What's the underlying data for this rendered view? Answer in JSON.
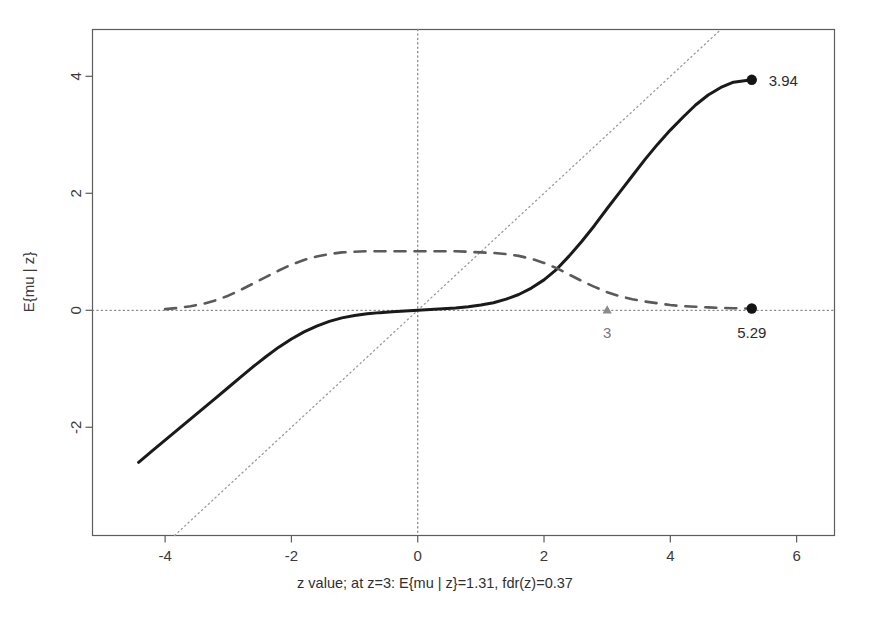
{
  "chart_data": {
    "type": "line",
    "title": "",
    "xlabel": "z value; at z=3: E{mu | z}=1.31, fdr(z)=0.37",
    "ylabel": "E{mu | z}",
    "xlim": [
      -5.15,
      6.6
    ],
    "ylim": [
      -3.85,
      4.8
    ],
    "xticks": [
      -4,
      -2,
      0,
      2,
      4,
      6
    ],
    "xtick_labels": [
      "-4",
      "-2",
      "0",
      "2",
      "4",
      "6"
    ],
    "yticks": [
      -2,
      0,
      2,
      4
    ],
    "ytick_labels": [
      "-2",
      "0",
      "2",
      "4"
    ],
    "grid": false,
    "legend": "none",
    "series": [
      {
        "name": "E{mu | z}",
        "style": "solid",
        "color": "#1a1a1a",
        "width": 3.0,
        "end_marker": "filled-circle",
        "x": [
          -4.42,
          -4.2,
          -4.0,
          -3.8,
          -3.6,
          -3.4,
          -3.2,
          -3.0,
          -2.8,
          -2.6,
          -2.4,
          -2.2,
          -2.0,
          -1.8,
          -1.6,
          -1.4,
          -1.2,
          -1.0,
          -0.8,
          -0.6,
          -0.4,
          -0.2,
          0.0,
          0.2,
          0.4,
          0.6,
          0.8,
          1.0,
          1.2,
          1.4,
          1.6,
          1.8,
          2.0,
          2.2,
          2.4,
          2.6,
          2.8,
          3.0,
          3.2,
          3.4,
          3.6,
          3.8,
          4.0,
          4.2,
          4.4,
          4.6,
          4.8,
          5.0,
          5.29
        ],
        "y": [
          -2.6,
          -2.4,
          -2.22,
          -2.04,
          -1.86,
          -1.68,
          -1.5,
          -1.32,
          -1.14,
          -0.96,
          -0.79,
          -0.63,
          -0.49,
          -0.37,
          -0.27,
          -0.19,
          -0.13,
          -0.09,
          -0.06,
          -0.04,
          -0.025,
          -0.012,
          0.0,
          0.012,
          0.025,
          0.04,
          0.06,
          0.09,
          0.13,
          0.19,
          0.27,
          0.38,
          0.52,
          0.7,
          0.93,
          1.18,
          1.45,
          1.74,
          2.02,
          2.3,
          2.58,
          2.84,
          3.08,
          3.3,
          3.51,
          3.68,
          3.81,
          3.9,
          3.94
        ]
      },
      {
        "name": "fdr(z)",
        "style": "dashed",
        "color": "#5a5a5a",
        "width": 2.6,
        "end_marker": "filled-circle",
        "x": [
          -4.0,
          -3.8,
          -3.6,
          -3.4,
          -3.2,
          -3.0,
          -2.8,
          -2.6,
          -2.4,
          -2.2,
          -2.0,
          -1.8,
          -1.6,
          -1.4,
          -1.2,
          -1.0,
          -0.8,
          -0.6,
          -0.4,
          -0.2,
          0.0,
          0.2,
          0.4,
          0.6,
          0.8,
          1.0,
          1.2,
          1.4,
          1.6,
          1.8,
          2.0,
          2.2,
          2.4,
          2.6,
          2.8,
          3.0,
          3.2,
          3.4,
          3.6,
          3.8,
          4.0,
          4.2,
          4.4,
          4.6,
          4.8,
          5.0,
          5.29
        ],
        "y": [
          0.02,
          0.04,
          0.07,
          0.11,
          0.17,
          0.25,
          0.35,
          0.46,
          0.57,
          0.68,
          0.78,
          0.86,
          0.92,
          0.96,
          0.99,
          1.0,
          1.01,
          1.01,
          1.01,
          1.01,
          1.01,
          1.01,
          1.01,
          1.01,
          1.0,
          0.99,
          0.98,
          0.96,
          0.93,
          0.88,
          0.81,
          0.72,
          0.61,
          0.5,
          0.4,
          0.31,
          0.24,
          0.19,
          0.15,
          0.12,
          0.09,
          0.07,
          0.06,
          0.05,
          0.04,
          0.035,
          0.03
        ]
      }
    ],
    "reference_lines": [
      {
        "name": "y-zero",
        "orientation": "horizontal",
        "value": 0,
        "style": "dotted",
        "color": "#8a8a8a"
      },
      {
        "name": "x-zero",
        "orientation": "vertical",
        "value": 0,
        "style": "dotted",
        "color": "#8a8a8a"
      },
      {
        "name": "identity",
        "orientation": "diagonal",
        "slope": 1,
        "intercept": 0,
        "style": "dotted",
        "color": "#9a9a9a"
      }
    ],
    "annotations": [
      {
        "name": "curve-end-value",
        "text": "3.94",
        "x": 5.29,
        "y": 3.94,
        "color": "#2b2b2b"
      },
      {
        "name": "fdr-end-value",
        "text": "5.29",
        "x": 5.29,
        "y": 0.03,
        "color": "#2b2b2b"
      },
      {
        "name": "z-equals-3-mark",
        "text": "3",
        "x": 3.0,
        "y": 0.0,
        "color": "#777777",
        "marker": "triangle"
      }
    ]
  },
  "axes": {
    "xlabel": "z value; at z=3: E{mu | z}=1.31, fdr(z)=0.37",
    "ylabel": "E{mu | z}",
    "xtick_labels": [
      "-4",
      "-2",
      "0",
      "2",
      "4",
      "6"
    ],
    "ytick_labels": [
      "-2",
      "0",
      "2",
      "4"
    ]
  },
  "annotations": {
    "end_label": "3.94",
    "fdr_end_label": "5.29",
    "z3_label": "3"
  },
  "colors": {
    "solid_curve": "#1a1a1a",
    "dashed_curve": "#5a5a5a",
    "reference": "#8a8a8a",
    "axis": "#5c5c5c",
    "text": "#3a3a3a",
    "gray_text": "#777777",
    "background": "#ffffff"
  }
}
